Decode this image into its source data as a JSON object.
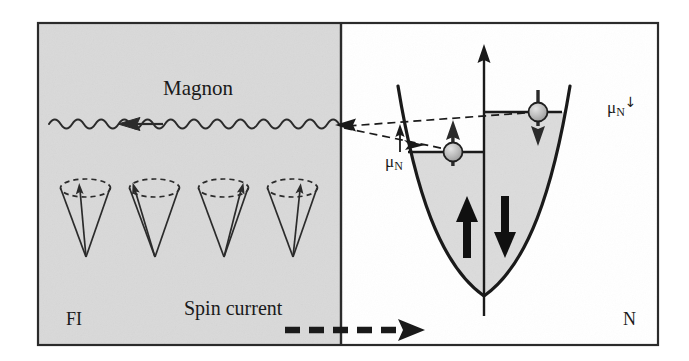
{
  "figure": {
    "regions": {
      "left": {
        "label": "FI",
        "name": "ferromagnetic-insulator",
        "fill_color": "#d9d9d9"
      },
      "right": {
        "label": "N",
        "name": "normal-metal",
        "fill_color": "#ffffff"
      }
    },
    "frame": {
      "stroke_color": "#1a1a1a"
    },
    "annotations": {
      "magnon": "Magnon",
      "spin_current": "Spin current"
    },
    "chemical_potentials": {
      "spin_up": {
        "base": "μ",
        "subscript": "N",
        "superscript": "↑"
      },
      "spin_down": {
        "base": "μ",
        "subscript": "N",
        "superscript": "↓"
      }
    },
    "band_diagram": {
      "axis_name": "energy-axis",
      "band_fill_color": "#dcdcdc",
      "electron_fill_color": "#b5b5b5",
      "spin_up_level_label": "spin-up Fermi level",
      "spin_down_level_label": "spin-down Fermi level",
      "majority_arrow": "↑",
      "minority_arrow": "↓"
    },
    "magnon_wave": {
      "direction": "left",
      "cycles": 13
    },
    "precession_cones": {
      "count": 4,
      "description": "precessing localized spins"
    }
  }
}
